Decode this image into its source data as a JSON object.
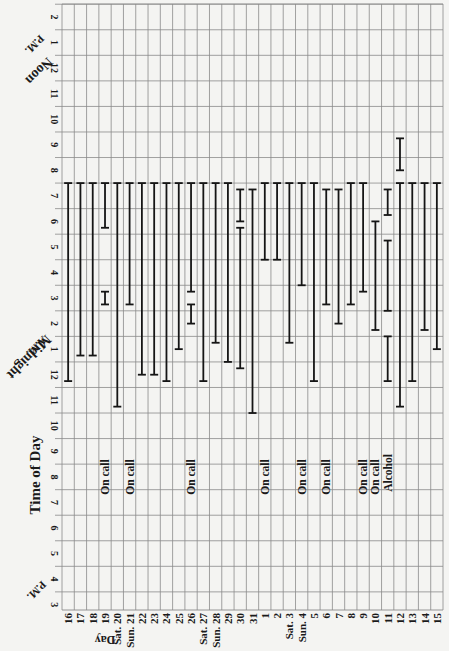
{
  "chart_data": {
    "type": "range-bar (sleep log)",
    "orientation": "rotated 90deg; time of day runs vertically, days run horizontally",
    "title": "",
    "ylabel": "Time of Day",
    "xlabel": "Day",
    "y_ticks": [
      "2",
      "1",
      "12",
      "11",
      "10",
      "9",
      "8",
      "7",
      "6",
      "5",
      "4",
      "3",
      "2",
      "1",
      "12",
      "11",
      "10",
      "9",
      "8",
      "7",
      "6",
      "5",
      "4",
      "3"
    ],
    "y_tick_hours_24": [
      14,
      13,
      12,
      11,
      10,
      9,
      8,
      7,
      6,
      5,
      4,
      3,
      2,
      1,
      0,
      23,
      22,
      21,
      20,
      19,
      18,
      17,
      16,
      15
    ],
    "y_annotations": [
      {
        "text": "Noon",
        "sub": "P.M.",
        "at_tick_index": 2
      },
      {
        "text": "Midnight",
        "sub": "A.M.",
        "at_tick_index": 14
      },
      {
        "text": "P.M.",
        "at_tick_index": 23
      }
    ],
    "categories": [
      "16",
      "17",
      "18",
      "19",
      "Sat. 20",
      "Sun. 21",
      "22",
      "23",
      "24",
      "25",
      "26",
      "Sat. 27",
      "Sun. 28",
      "29",
      "30",
      "31",
      "1",
      "2",
      "Sat. 3",
      "Sun. 4",
      "5",
      "6",
      "7",
      "8",
      "9",
      "10",
      "11",
      "12",
      "13",
      "14",
      "15"
    ],
    "notes": [
      "",
      "",
      "",
      "On call",
      "",
      "On call",
      "",
      "",
      "",
      "",
      "On call",
      "",
      "",
      "",
      "",
      "",
      "On call",
      "",
      "",
      "On call",
      "",
      "On call",
      "",
      "",
      "On call",
      "On call",
      "Alcohol",
      "",
      "",
      "",
      ""
    ],
    "sleep_segments": [
      [
        {
          "bed": "23:45",
          "wake": "7:30"
        }
      ],
      [
        {
          "bed": "0:45",
          "wake": "7:30"
        }
      ],
      [
        {
          "bed": "0:45",
          "wake": "7:30"
        }
      ],
      [
        {
          "bed": "2:45",
          "wake": "3:15"
        },
        {
          "bed": "5:45",
          "wake": "7:30"
        }
      ],
      [
        {
          "bed": "22:45",
          "wake": "7:30"
        }
      ],
      [
        {
          "bed": "2:45",
          "wake": "7:30"
        }
      ],
      [
        {
          "bed": "0:00",
          "wake": "7:30"
        }
      ],
      [
        {
          "bed": "0:00",
          "wake": "7:30"
        }
      ],
      [
        {
          "bed": "23:45",
          "wake": "7:30"
        }
      ],
      [
        {
          "bed": "1:00",
          "wake": "7:30"
        }
      ],
      [
        {
          "bed": "2:00",
          "wake": "2:45"
        },
        {
          "bed": "3:15",
          "wake": "7:30"
        }
      ],
      [
        {
          "bed": "23:45",
          "wake": "7:30"
        }
      ],
      [
        {
          "bed": "1:15",
          "wake": "7:30"
        }
      ],
      [
        {
          "bed": "0:30",
          "wake": "7:30"
        }
      ],
      [
        {
          "bed": "0:15",
          "wake": "5:45"
        },
        {
          "bed": "6:00",
          "wake": "7:15"
        }
      ],
      [
        {
          "bed": "22:30",
          "wake": "7:15"
        }
      ],
      [
        {
          "bed": "4:30",
          "wake": "7:30"
        }
      ],
      [
        {
          "bed": "4:30",
          "wake": "7:30"
        }
      ],
      [
        {
          "bed": "1:15",
          "wake": "7:30"
        }
      ],
      [
        {
          "bed": "3:30",
          "wake": "7:30"
        }
      ],
      [
        {
          "bed": "23:45",
          "wake": "7:30"
        }
      ],
      [
        {
          "bed": "2:45",
          "wake": "7:15"
        }
      ],
      [
        {
          "bed": "2:00",
          "wake": "7:15"
        }
      ],
      [
        {
          "bed": "2:45",
          "wake": "7:30"
        }
      ],
      [
        {
          "bed": "3:15",
          "wake": "7:30"
        }
      ],
      [
        {
          "bed": "1:45",
          "wake": "6:00"
        }
      ],
      [
        {
          "bed": "23:45",
          "wake": "1:30"
        },
        {
          "bed": "2:30",
          "wake": "5:15"
        },
        {
          "bed": "6:15",
          "wake": "7:15"
        }
      ],
      [
        {
          "bed": "22:45",
          "wake": "7:30"
        },
        {
          "bed": "8:00",
          "wake": "9:15"
        }
      ],
      [
        {
          "bed": "23:45",
          "wake": "7:30"
        }
      ],
      [
        {
          "bed": "1:45",
          "wake": "7:30"
        }
      ],
      [
        {
          "bed": "1:00",
          "wake": "7:30"
        }
      ]
    ],
    "grid": true,
    "legend": null
  },
  "labels": {
    "time_of_day": "Time of Day",
    "day": "Day",
    "noon": "Noon",
    "pm_top": "P.M.",
    "midnight": "Midnight",
    "am": "A.M.",
    "pm_bottom": "P.M."
  },
  "colors": {
    "background": "#f4f4f2",
    "grid": "#8a8a8a",
    "bars": "#151515",
    "text": "#1a1a1a"
  }
}
